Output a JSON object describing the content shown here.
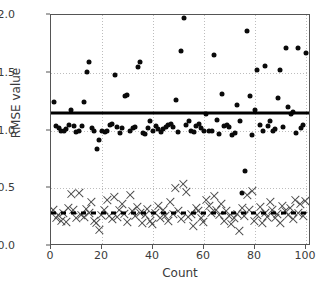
{
  "chart_data": {
    "type": "scatter",
    "title": "",
    "xlabel": "Count",
    "ylabel": "RMSE value",
    "xlim": [
      0,
      102
    ],
    "ylim": [
      0.0,
      2.0
    ],
    "xticks": [
      0,
      20,
      40,
      60,
      80,
      100
    ],
    "yticks": [
      "0.0",
      "0.5",
      "1.0",
      "1.5",
      "2.0"
    ],
    "grid": true,
    "grid_style": "dotted",
    "legend": "none",
    "series": [
      {
        "name": "upper-scatter",
        "marker": "circle",
        "color": "#0a0a0a",
        "points": [
          [
            1,
            1.25
          ],
          [
            2,
            1.04
          ],
          [
            3,
            1.02
          ],
          [
            4,
            1.0
          ],
          [
            5,
            1.0
          ],
          [
            6,
            1.01
          ],
          [
            7,
            1.05
          ],
          [
            8,
            1.18
          ],
          [
            9,
            1.04
          ],
          [
            10,
            0.99
          ],
          [
            11,
            1.0
          ],
          [
            12,
            1.04
          ],
          [
            13,
            1.25
          ],
          [
            14,
            1.51
          ],
          [
            15,
            1.59
          ],
          [
            16,
            1.02
          ],
          [
            17,
            1.0
          ],
          [
            18,
            0.84
          ],
          [
            19,
            0.92
          ],
          [
            20,
            1.0
          ],
          [
            21,
            0.99
          ],
          [
            22,
            1.0
          ],
          [
            23,
            1.05
          ],
          [
            24,
            1.06
          ],
          [
            25,
            1.48
          ],
          [
            26,
            1.03
          ],
          [
            27,
            0.98
          ],
          [
            28,
            1.02
          ],
          [
            29,
            1.3
          ],
          [
            30,
            1.31
          ],
          [
            31,
            1.0
          ],
          [
            32,
            1.02
          ],
          [
            33,
            1.03
          ],
          [
            34,
            1.55
          ],
          [
            35,
            1.59
          ],
          [
            36,
            0.98
          ],
          [
            37,
            0.97
          ],
          [
            38,
            1.02
          ],
          [
            39,
            1.08
          ],
          [
            40,
            1.0
          ],
          [
            41,
            1.04
          ],
          [
            42,
            1.01
          ],
          [
            43,
            0.99
          ],
          [
            44,
            1.01
          ],
          [
            45,
            1.03
          ],
          [
            46,
            1.05
          ],
          [
            47,
            1.06
          ],
          [
            48,
            1.03
          ],
          [
            49,
            1.26
          ],
          [
            50,
            0.99
          ],
          [
            51,
            1.69
          ],
          [
            52,
            1.97
          ],
          [
            53,
            1.05
          ],
          [
            54,
            1.08
          ],
          [
            55,
            1.0
          ],
          [
            56,
            0.99
          ],
          [
            57,
            1.04
          ],
          [
            58,
            1.06
          ],
          [
            59,
            1.02
          ],
          [
            60,
            1.0
          ],
          [
            61,
            1.14
          ],
          [
            62,
            1.0
          ],
          [
            63,
            1.0
          ],
          [
            64,
            1.65
          ],
          [
            65,
            1.09
          ],
          [
            66,
            0.97
          ],
          [
            67,
            1.32
          ],
          [
            68,
            1.04
          ],
          [
            69,
            1.05
          ],
          [
            70,
            1.03
          ],
          [
            71,
            0.96
          ],
          [
            72,
            0.98
          ],
          [
            73,
            1.22
          ],
          [
            74,
            1.08
          ],
          [
            75,
            0.46
          ],
          [
            76,
            0.65
          ],
          [
            77,
            1.86
          ],
          [
            78,
            1.3
          ],
          [
            79,
            0.96
          ],
          [
            80,
            1.18
          ],
          [
            81,
            1.52
          ],
          [
            82,
            1.05
          ],
          [
            83,
            1.0
          ],
          [
            84,
            1.56
          ],
          [
            85,
            1.04
          ],
          [
            86,
            1.08
          ],
          [
            87,
            1.0
          ],
          [
            88,
            1.01
          ],
          [
            89,
            1.28
          ],
          [
            90,
            1.52
          ],
          [
            91,
            1.03
          ],
          [
            92,
            1.71
          ],
          [
            93,
            1.2
          ],
          [
            94,
            1.14
          ],
          [
            95,
            1.16
          ],
          [
            96,
            0.98
          ],
          [
            97,
            1.71
          ],
          [
            98,
            1.02
          ],
          [
            99,
            1.05
          ],
          [
            100,
            1.67
          ]
        ]
      },
      {
        "name": "lower-scatter",
        "marker": "x",
        "color": "#4a4a4a",
        "points": [
          [
            1,
            0.31
          ],
          [
            2,
            0.24
          ],
          [
            3,
            0.27
          ],
          [
            4,
            0.22
          ],
          [
            5,
            0.29
          ],
          [
            6,
            0.21
          ],
          [
            7,
            0.33
          ],
          [
            8,
            0.45
          ],
          [
            9,
            0.31
          ],
          [
            10,
            0.24
          ],
          [
            11,
            0.46
          ],
          [
            12,
            0.27
          ],
          [
            13,
            0.25
          ],
          [
            14,
            0.32
          ],
          [
            15,
            0.29
          ],
          [
            16,
            0.38
          ],
          [
            17,
            0.22
          ],
          [
            18,
            0.2
          ],
          [
            19,
            0.14
          ],
          [
            20,
            0.27
          ],
          [
            21,
            0.31
          ],
          [
            22,
            0.4
          ],
          [
            23,
            0.26
          ],
          [
            24,
            0.23
          ],
          [
            25,
            0.42
          ],
          [
            26,
            0.25
          ],
          [
            27,
            0.31
          ],
          [
            28,
            0.36
          ],
          [
            29,
            0.28
          ],
          [
            30,
            0.21
          ],
          [
            31,
            0.44
          ],
          [
            32,
            0.3
          ],
          [
            33,
            0.26
          ],
          [
            34,
            0.34
          ],
          [
            35,
            0.29
          ],
          [
            36,
            0.2
          ],
          [
            37,
            0.27
          ],
          [
            38,
            0.32
          ],
          [
            39,
            0.22
          ],
          [
            40,
            0.19
          ],
          [
            41,
            0.29
          ],
          [
            42,
            0.35
          ],
          [
            43,
            0.24
          ],
          [
            44,
            0.31
          ],
          [
            45,
            0.26
          ],
          [
            46,
            0.22
          ],
          [
            47,
            0.38
          ],
          [
            48,
            0.28
          ],
          [
            49,
            0.5
          ],
          [
            50,
            0.3
          ],
          [
            51,
            0.23
          ],
          [
            52,
            0.54
          ],
          [
            53,
            0.47
          ],
          [
            54,
            0.25
          ],
          [
            55,
            0.28
          ],
          [
            56,
            0.17
          ],
          [
            57,
            0.33
          ],
          [
            58,
            0.3
          ],
          [
            59,
            0.24
          ],
          [
            60,
            0.21
          ],
          [
            61,
            0.4
          ],
          [
            62,
            0.35
          ],
          [
            63,
            0.29
          ],
          [
            64,
            0.43
          ],
          [
            65,
            0.31
          ],
          [
            66,
            0.27
          ],
          [
            67,
            0.36
          ],
          [
            68,
            0.22
          ],
          [
            69,
            0.3
          ],
          [
            70,
            0.26
          ],
          [
            71,
            0.19
          ],
          [
            72,
            0.24
          ],
          [
            73,
            0.28
          ],
          [
            74,
            0.13
          ],
          [
            75,
            0.33
          ],
          [
            76,
            0.26
          ],
          [
            77,
            0.44
          ],
          [
            78,
            0.31
          ],
          [
            79,
            0.48
          ],
          [
            80,
            0.22
          ],
          [
            81,
            0.27
          ],
          [
            82,
            0.34
          ],
          [
            83,
            0.2
          ],
          [
            84,
            0.29
          ],
          [
            85,
            0.25
          ],
          [
            86,
            0.38
          ],
          [
            87,
            0.31
          ],
          [
            88,
            0.24
          ],
          [
            89,
            0.28
          ],
          [
            90,
            0.2
          ],
          [
            91,
            0.35
          ],
          [
            92,
            0.3
          ],
          [
            93,
            0.27
          ],
          [
            94,
            0.33
          ],
          [
            95,
            0.23
          ],
          [
            96,
            0.4
          ],
          [
            97,
            0.29
          ],
          [
            98,
            0.36
          ],
          [
            99,
            0.26
          ],
          [
            100,
            0.39
          ]
        ]
      }
    ],
    "reference_lines": [
      {
        "name": "upper-mean-line",
        "value": 1.15,
        "style": "solid",
        "color": "#000000"
      },
      {
        "name": "lower-mean-line",
        "value": 0.29,
        "style": "dotted",
        "color": "#000000"
      }
    ]
  }
}
